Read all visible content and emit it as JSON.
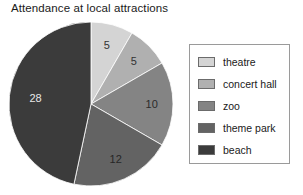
{
  "chart_data": {
    "type": "pie",
    "title": "Attendance at local attractions",
    "xlabel": "",
    "ylabel": "",
    "categories": [
      "theatre",
      "concert hall",
      "zoo",
      "theme park",
      "beach"
    ],
    "values": [
      5,
      5,
      10,
      12,
      28
    ],
    "total": 60,
    "start_angle_deg": 0,
    "direction": "clockwise",
    "legend_position": "right",
    "grid": false,
    "colors": [
      "#d4d4d4",
      "#b0b0b0",
      "#848484",
      "#636363",
      "#3b3b3b"
    ],
    "slice_label_colors": [
      "#333333",
      "#333333",
      "#2b2b2b",
      "#262626",
      "#e8e8e8"
    ],
    "slices": [
      {
        "label": "theatre",
        "value": 5,
        "color": "#d4d4d4",
        "label_text": "5"
      },
      {
        "label": "concert hall",
        "value": 5,
        "color": "#b0b0b0",
        "label_text": "5"
      },
      {
        "label": "zoo",
        "value": 10,
        "color": "#848484",
        "label_text": "10"
      },
      {
        "label": "theme park",
        "value": 12,
        "color": "#636363",
        "label_text": "12"
      },
      {
        "label": "beach",
        "value": 28,
        "color": "#3b3b3b",
        "label_text": "28"
      }
    ]
  },
  "legend": {
    "items": [
      {
        "label": "theatre",
        "color": "#d4d4d4"
      },
      {
        "label": "concert hall",
        "color": "#b0b0b0"
      },
      {
        "label": "zoo",
        "color": "#848484"
      },
      {
        "label": "theme park",
        "color": "#636363"
      },
      {
        "label": "beach",
        "color": "#3b3b3b"
      }
    ]
  }
}
